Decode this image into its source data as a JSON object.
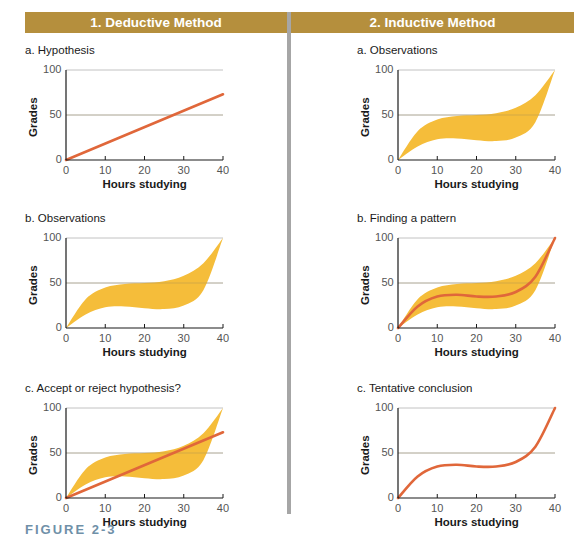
{
  "headers": {
    "left": "1. Deductive Method",
    "right": "2. Inductive Method"
  },
  "figure_label": "FIGURE 2-3",
  "axes": {
    "xlabel": "Hours studying",
    "ylabel": "Grades",
    "xticks": [
      "0",
      "10",
      "20",
      "30",
      "40"
    ],
    "yticks": [
      "0",
      "50",
      "100"
    ]
  },
  "colors": {
    "header": "#b58f3d",
    "band": "#f5bd3a",
    "line": "#e0673a",
    "grid": "#b3b3b3",
    "axis": "#1a1a1a",
    "figure_label": "#6f90a8"
  },
  "panels": {
    "left": [
      {
        "title": "a. Hypothesis"
      },
      {
        "title": "b. Observations"
      },
      {
        "title": "c. Accept or reject hypothesis?"
      }
    ],
    "right": [
      {
        "title": "a. Observations"
      },
      {
        "title": "b. Finding a pattern"
      },
      {
        "title": "c. Tentative conclusion"
      }
    ]
  },
  "chart_data": [
    {
      "type": "line",
      "title": "a. Hypothesis",
      "xlabel": "Hours studying",
      "ylabel": "Grades",
      "xlim": [
        0,
        40
      ],
      "ylim": [
        0,
        100
      ],
      "grid": "horizontal at 50 and 100",
      "series": [
        {
          "name": "hypothesis",
          "x": [
            0,
            40
          ],
          "y": [
            0,
            73
          ]
        }
      ]
    },
    {
      "type": "area",
      "title": "b. Observations",
      "xlabel": "Hours studying",
      "ylabel": "Grades",
      "xlim": [
        0,
        40
      ],
      "ylim": [
        0,
        100
      ],
      "series": [
        {
          "name": "upper",
          "x": [
            0,
            5,
            10,
            15,
            20,
            25,
            30,
            35,
            40
          ],
          "y": [
            0,
            32,
            45,
            49,
            50,
            52,
            58,
            72,
            100
          ]
        },
        {
          "name": "lower",
          "x": [
            0,
            5,
            10,
            15,
            20,
            25,
            30,
            35,
            40
          ],
          "y": [
            0,
            15,
            23,
            24,
            22,
            21,
            25,
            42,
            100
          ]
        }
      ]
    },
    {
      "type": "area",
      "title": "c. Accept or reject hypothesis?",
      "xlabel": "Hours studying",
      "ylabel": "Grades",
      "xlim": [
        0,
        40
      ],
      "ylim": [
        0,
        100
      ],
      "series": [
        {
          "name": "upper",
          "x": [
            0,
            5,
            10,
            15,
            20,
            25,
            30,
            35,
            40
          ],
          "y": [
            0,
            32,
            45,
            49,
            50,
            52,
            58,
            72,
            100
          ]
        },
        {
          "name": "lower",
          "x": [
            0,
            5,
            10,
            15,
            20,
            25,
            30,
            35,
            40
          ],
          "y": [
            0,
            15,
            23,
            24,
            22,
            21,
            25,
            42,
            100
          ]
        },
        {
          "name": "hypothesis",
          "x": [
            0,
            40
          ],
          "y": [
            0,
            73
          ]
        }
      ]
    },
    {
      "type": "area",
      "title": "a. Observations",
      "xlabel": "Hours studying",
      "ylabel": "Grades",
      "xlim": [
        0,
        40
      ],
      "ylim": [
        0,
        100
      ],
      "series": [
        {
          "name": "upper",
          "x": [
            0,
            5,
            10,
            15,
            20,
            25,
            30,
            35,
            40
          ],
          "y": [
            0,
            32,
            45,
            49,
            50,
            52,
            58,
            72,
            100
          ]
        },
        {
          "name": "lower",
          "x": [
            0,
            5,
            10,
            15,
            20,
            25,
            30,
            35,
            40
          ],
          "y": [
            0,
            15,
            23,
            24,
            22,
            21,
            25,
            42,
            100
          ]
        }
      ]
    },
    {
      "type": "area",
      "title": "b. Finding a pattern",
      "xlabel": "Hours studying",
      "ylabel": "Grades",
      "xlim": [
        0,
        40
      ],
      "ylim": [
        0,
        100
      ],
      "series": [
        {
          "name": "upper",
          "x": [
            0,
            5,
            10,
            15,
            20,
            25,
            30,
            35,
            40
          ],
          "y": [
            0,
            32,
            45,
            49,
            50,
            52,
            58,
            72,
            100
          ]
        },
        {
          "name": "lower",
          "x": [
            0,
            5,
            10,
            15,
            20,
            25,
            30,
            35,
            40
          ],
          "y": [
            0,
            15,
            23,
            24,
            22,
            21,
            25,
            42,
            100
          ]
        },
        {
          "name": "pattern",
          "x": [
            0,
            5,
            10,
            15,
            20,
            25,
            30,
            35,
            40
          ],
          "y": [
            0,
            24,
            35,
            37,
            35,
            35,
            40,
            57,
            100
          ]
        }
      ]
    },
    {
      "type": "line",
      "title": "c. Tentative conclusion",
      "xlabel": "Hours studying",
      "ylabel": "Grades",
      "xlim": [
        0,
        40
      ],
      "ylim": [
        0,
        100
      ],
      "series": [
        {
          "name": "conclusion",
          "x": [
            0,
            5,
            10,
            15,
            20,
            25,
            30,
            35,
            40
          ],
          "y": [
            0,
            24,
            35,
            37,
            35,
            35,
            40,
            57,
            100
          ]
        }
      ]
    }
  ]
}
